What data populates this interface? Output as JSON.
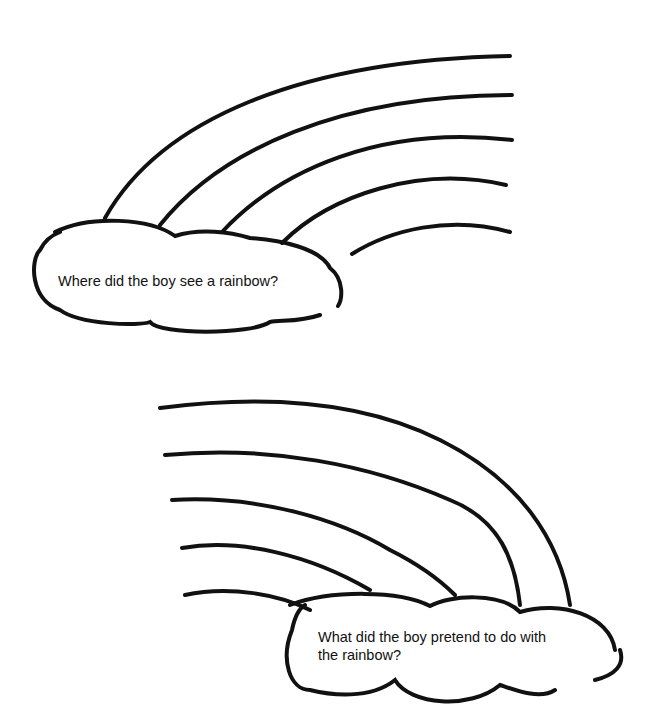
{
  "worksheet": {
    "rainbow_1": {
      "question": "Where did the boy see a rainbow?",
      "stripe_count": 5,
      "orientation": "rising to the right"
    },
    "rainbow_2": {
      "question_line1": "What did the boy pretend to do with",
      "question_line2": "the rainbow?",
      "stripe_count": 5,
      "orientation": "descending to the right"
    },
    "colors": {
      "ink": "#111111",
      "paper": "#ffffff"
    }
  }
}
